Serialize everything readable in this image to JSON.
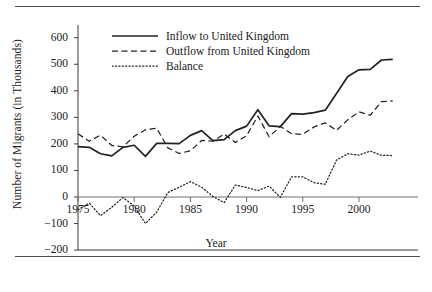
{
  "figure": {
    "ylabel": "Number of Migrants (in Thousands)",
    "xlabel": "Year"
  },
  "legend": {
    "items": [
      {
        "label": "Inflow to United Kingdom",
        "style": "solid",
        "key_name": "legend-key-inflow"
      },
      {
        "label": "Outflow from United Kingdom",
        "style": "dashed",
        "key_name": "legend-key-outflow"
      },
      {
        "label": "Balance",
        "style": "dotted",
        "key_name": "legend-key-balance"
      }
    ]
  },
  "axes": {
    "y_ticks": [
      "600",
      "500",
      "400",
      "300",
      "200",
      "100",
      "0",
      "-100",
      "-200"
    ],
    "x_ticks": [
      "1975",
      "1980",
      "1985",
      "1990",
      "1995",
      "2000"
    ]
  },
  "chart_data": {
    "type": "line",
    "title": "",
    "xlabel": "Year",
    "ylabel": "Number of Migrants (in Thousands)",
    "xlim": [
      1975,
      2003
    ],
    "ylim": [
      -200,
      600
    ],
    "grid": false,
    "legend_position": "upper-left-inside",
    "x": [
      1975,
      1976,
      1977,
      1978,
      1979,
      1980,
      1981,
      1982,
      1983,
      1984,
      1985,
      1986,
      1987,
      1988,
      1989,
      1990,
      1991,
      1992,
      1993,
      1994,
      1995,
      1996,
      1997,
      1998,
      1999,
      2000,
      2001,
      2002,
      2003
    ],
    "series": [
      {
        "name": "Inflow to United Kingdom",
        "style": "solid",
        "values": [
          190,
          187,
          163,
          155,
          187,
          195,
          153,
          202,
          202,
          201,
          232,
          250,
          212,
          216,
          250,
          267,
          329,
          268,
          265,
          314,
          312,
          318,
          327,
          390,
          454,
          479,
          481,
          516,
          518
        ]
      },
      {
        "name": "Outflow from United Kingdom",
        "style": "dashed",
        "values": [
          238,
          210,
          233,
          194,
          189,
          229,
          253,
          259,
          185,
          164,
          174,
          213,
          210,
          237,
          205,
          231,
          305,
          227,
          266,
          238,
          236,
          264,
          279,
          251,
          291,
          321,
          308,
          359,
          362
        ]
      },
      {
        "name": "Balance",
        "style": "dotted",
        "values": [
          -48,
          -23,
          -70,
          -39,
          -2,
          -34,
          -100,
          -57,
          17,
          37,
          58,
          37,
          2,
          -21,
          45,
          36,
          24,
          41,
          -1,
          76,
          76,
          54,
          48,
          139,
          163,
          158,
          173,
          157,
          156
        ]
      }
    ]
  }
}
